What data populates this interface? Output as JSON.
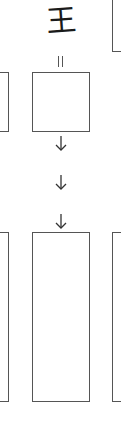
{
  "diagram": {
    "title_glyph": "王",
    "connector_glyph": "=",
    "stroke_color": "#555555",
    "text_color": "#1a1a1a",
    "background": "#ffffff",
    "nodes": [
      {
        "id": "top-right-box",
        "label": ""
      },
      {
        "id": "middle-left-box",
        "label": ""
      },
      {
        "id": "middle-center-box",
        "label": ""
      },
      {
        "id": "bottom-left-box",
        "label": ""
      },
      {
        "id": "bottom-center-box",
        "label": ""
      },
      {
        "id": "bottom-right-box",
        "label": ""
      }
    ],
    "edges": [
      {
        "from": "title_glyph",
        "to": "middle-center-box",
        "type": "equals"
      },
      {
        "from": "middle-center-box",
        "to": "bottom-center-box",
        "type": "arrow-down",
        "count": 3
      }
    ]
  }
}
